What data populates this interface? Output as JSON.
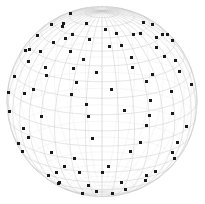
{
  "figure": {
    "name": "globe-scatter-plot",
    "title": "",
    "width": 205,
    "height": 204,
    "background_color": "#ffffff"
  },
  "chart_data": {
    "type": "scatter",
    "projection": "orthographic-sphere",
    "title": "",
    "subtitle": "",
    "xlabel": "",
    "ylabel": "",
    "legend": [],
    "annotations": [],
    "grid": true,
    "sphere": {
      "center_x": 102,
      "center_y": 101.5,
      "radius": 95,
      "outline_color": "#d4d4d4",
      "outline_width": 0.8
    },
    "graticule": {
      "latitude_step_deg": 10,
      "longitude_step_deg": 10,
      "line_color": "#c8c8c8",
      "line_width": 0.45,
      "back_line_color": "#e6e6e6",
      "back_line_width": 0.35
    },
    "camera": {
      "rotation_lambda_deg": -20,
      "rotation_phi_deg": 18,
      "note": "north pole near top, south polar cap visible at lower rim"
    },
    "marker": {
      "shape": "square",
      "size_px": 3,
      "color": "#1a1a1a",
      "count": 208
    },
    "points_lonlat": [
      [
        -152,
        62
      ],
      [
        -118,
        66
      ],
      [
        -86,
        70
      ],
      [
        -46,
        63
      ],
      [
        -12,
        72
      ],
      [
        25,
        67
      ],
      [
        62,
        60
      ],
      [
        100,
        64
      ],
      [
        138,
        58
      ],
      [
        170,
        55
      ],
      [
        -176,
        52
      ],
      [
        -140,
        49
      ],
      [
        -104,
        55
      ],
      [
        -70,
        47
      ],
      [
        -34,
        51
      ],
      [
        4,
        44
      ],
      [
        40,
        53
      ],
      [
        76,
        46
      ],
      [
        112,
        42
      ],
      [
        148,
        50
      ],
      [
        -166,
        38
      ],
      [
        -130,
        41
      ],
      [
        -94,
        33
      ],
      [
        -58,
        39
      ],
      [
        -22,
        30
      ],
      [
        16,
        36
      ],
      [
        52,
        28
      ],
      [
        88,
        34
      ],
      [
        124,
        26
      ],
      [
        160,
        32
      ],
      [
        -178,
        22
      ],
      [
        -144,
        27
      ],
      [
        -110,
        18
      ],
      [
        -74,
        24
      ],
      [
        -38,
        15
      ],
      [
        0,
        21
      ],
      [
        34,
        12
      ],
      [
        70,
        18
      ],
      [
        106,
        9
      ],
      [
        142,
        16
      ],
      [
        176,
        6
      ],
      [
        -160,
        11
      ],
      [
        -126,
        2
      ],
      [
        -92,
        8
      ],
      [
        -56,
        -2
      ],
      [
        -20,
        5
      ],
      [
        14,
        -5
      ],
      [
        48,
        1
      ],
      [
        84,
        -8
      ],
      [
        120,
        -3
      ],
      [
        156,
        -11
      ],
      [
        -170,
        -6
      ],
      [
        -136,
        -14
      ],
      [
        -102,
        -9
      ],
      [
        -68,
        -17
      ],
      [
        -32,
        -12
      ],
      [
        2,
        -20
      ],
      [
        38,
        -15
      ],
      [
        74,
        -23
      ],
      [
        110,
        -18
      ],
      [
        146,
        -26
      ],
      [
        180,
        -21
      ],
      [
        -154,
        -29
      ],
      [
        -120,
        -24
      ],
      [
        -86,
        -32
      ],
      [
        -50,
        -27
      ],
      [
        -16,
        -35
      ],
      [
        20,
        -30
      ],
      [
        56,
        -38
      ],
      [
        92,
        -33
      ],
      [
        128,
        -41
      ],
      [
        164,
        -36
      ],
      [
        -162,
        -44
      ],
      [
        -128,
        -39
      ],
      [
        -94,
        -47
      ],
      [
        -60,
        -42
      ],
      [
        -26,
        -50
      ],
      [
        8,
        -45
      ],
      [
        44,
        -53
      ],
      [
        80,
        -48
      ],
      [
        116,
        -56
      ],
      [
        152,
        -51
      ],
      [
        -174,
        -59
      ],
      [
        -140,
        -54
      ],
      [
        -106,
        -62
      ],
      [
        -72,
        -57
      ],
      [
        -38,
        -65
      ],
      [
        -4,
        -60
      ],
      [
        30,
        -68
      ],
      [
        66,
        -63
      ],
      [
        102,
        -71
      ],
      [
        138,
        -66
      ],
      [
        174,
        -74
      ],
      [
        -148,
        -69
      ],
      [
        -114,
        -77
      ],
      [
        -80,
        -72
      ],
      [
        -46,
        -80
      ],
      [
        -12,
        -75
      ],
      [
        22,
        -83
      ],
      [
        58,
        -78
      ],
      [
        94,
        -86
      ],
      [
        130,
        -81
      ],
      [
        166,
        -84
      ],
      [
        -158,
        -79
      ],
      [
        -124,
        -73
      ],
      [
        -90,
        -67
      ],
      [
        -142,
        18
      ],
      [
        -108,
        43
      ],
      [
        -62,
        8
      ],
      [
        -28,
        -41
      ],
      [
        6,
        58
      ],
      [
        44,
        -9
      ],
      [
        78,
        39
      ],
      [
        114,
        -35
      ],
      [
        150,
        10
      ],
      [
        -184,
        44
      ],
      [
        -150,
        -20
      ],
      [
        -116,
        28
      ],
      [
        -82,
        -53
      ],
      [
        -48,
        33
      ],
      [
        -14,
        -18
      ],
      [
        26,
        25
      ],
      [
        60,
        -44
      ],
      [
        96,
        15
      ],
      [
        132,
        -12
      ],
      [
        168,
        42
      ],
      [
        -172,
        -36
      ],
      [
        -138,
        60
      ],
      [
        -104,
        -28
      ],
      [
        -70,
        58
      ],
      [
        -36,
        -7
      ],
      [
        -2,
        37
      ],
      [
        32,
        -59
      ],
      [
        68,
        5
      ],
      [
        104,
        50
      ],
      [
        140,
        -48
      ],
      [
        176,
        27
      ],
      [
        -166,
        14
      ],
      [
        -132,
        -50
      ],
      [
        -98,
        46
      ],
      [
        -64,
        -65
      ],
      [
        -30,
        19
      ],
      [
        4,
        -31
      ],
      [
        40,
        63
      ],
      [
        76,
        -16
      ],
      [
        112,
        58
      ],
      [
        148,
        -30
      ],
      [
        -180,
        35
      ],
      [
        -146,
        6
      ],
      [
        -112,
        -42
      ],
      [
        -78,
        26
      ],
      [
        -44,
        -56
      ],
      [
        -10,
        48
      ],
      [
        24,
        -25
      ],
      [
        58,
        31
      ],
      [
        94,
        -57
      ],
      [
        128,
        20
      ],
      [
        162,
        -4
      ],
      [
        -156,
        -60
      ],
      [
        -122,
        37
      ],
      [
        -88,
        -15
      ],
      [
        -54,
        65
      ],
      [
        -20,
        -46
      ],
      [
        12,
        9
      ],
      [
        46,
        44
      ],
      [
        82,
        -30
      ],
      [
        118,
        33
      ],
      [
        154,
        -67
      ],
      [
        -184,
        -10
      ],
      [
        -150,
        44
      ],
      [
        -118,
        -34
      ],
      [
        -84,
        58
      ],
      [
        -52,
        -22
      ],
      [
        -18,
        60
      ],
      [
        18,
        -66
      ],
      [
        52,
        16
      ],
      [
        88,
        52
      ],
      [
        124,
        -24
      ],
      [
        158,
        48
      ],
      [
        -176,
        -46
      ],
      [
        -142,
        31
      ],
      [
        -108,
        -58
      ],
      [
        -74,
        13
      ],
      [
        -40,
        42
      ],
      [
        -6,
        -27
      ],
      [
        28,
        53
      ],
      [
        64,
        -36
      ],
      [
        100,
        -4
      ],
      [
        136,
        40
      ],
      [
        172,
        -55
      ],
      [
        -162,
        24
      ],
      [
        -130,
        -8
      ],
      [
        -96,
        62
      ],
      [
        -60,
        -48
      ],
      [
        -26,
        34
      ],
      [
        10,
        16
      ],
      [
        44,
        38
      ],
      [
        80,
        -62
      ],
      [
        116,
        46
      ],
      [
        152,
        -18
      ],
      [
        -170,
        56
      ],
      [
        -136,
        -30
      ],
      [
        -100,
        21
      ],
      [
        -66,
        36
      ],
      [
        -32,
        -70
      ],
      [
        2,
        29
      ],
      [
        36,
        -42
      ],
      [
        72,
        59
      ],
      [
        108,
        -50
      ],
      [
        144,
        8
      ],
      [
        178,
        34
      ],
      [
        -158,
        -14
      ],
      [
        -126,
        52
      ],
      [
        -92,
        -38
      ],
      [
        -58,
        20
      ],
      [
        -24,
        56
      ],
      [
        14,
        -54
      ],
      [
        50,
        7
      ],
      [
        86,
        27
      ],
      [
        122,
        -60
      ],
      [
        156,
        60
      ],
      [
        -168,
        -24
      ],
      [
        -134,
        12
      ]
    ]
  }
}
